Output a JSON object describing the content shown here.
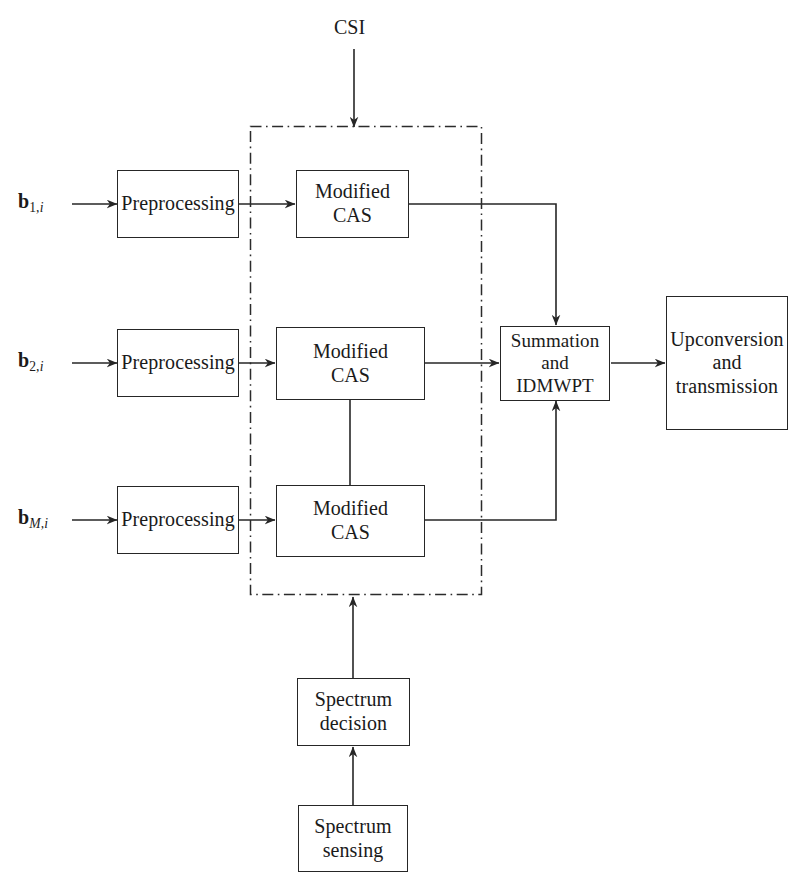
{
  "diagram": {
    "canvas": {
      "width": 802,
      "height": 893
    },
    "colors": {
      "stroke": "#262626",
      "background": "#ffffff",
      "group_stroke": "#2b2b2b"
    }
  },
  "inputs": {
    "signal_1": {
      "vector": "b",
      "sub_index": "1,",
      "sub_italic": "i"
    },
    "signal_2": {
      "vector": "b",
      "sub_index": "2,",
      "sub_italic": "i"
    },
    "signal_m": {
      "vector": "b",
      "sub_index": "",
      "sub_italic": "M,i"
    }
  },
  "labels": {
    "csi": "CSI"
  },
  "nodes": {
    "preprocessing_1": "Preprocessing",
    "preprocessing_2": "Preprocessing",
    "preprocessing_m": "Preprocessing",
    "modified_cas_1": "Modified\nCAS",
    "modified_cas_2": "Modified\nCAS",
    "modified_cas_m": "Modified\nCAS",
    "summation_idmwpt": "Summation\nand\nIDMWPT",
    "upconversion": "Upconversion\nand\ntransmission",
    "spectrum_decision": "Spectrum\ndecision",
    "spectrum_sensing": "Spectrum\nsensing"
  },
  "group": {
    "name": "cognitive-processing-region",
    "style": "dash-dot",
    "bounds": {
      "x": 250,
      "y": 126,
      "width": 232,
      "height": 469
    }
  }
}
